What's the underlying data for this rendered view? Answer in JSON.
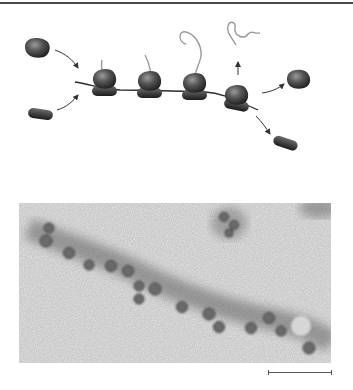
{
  "figure": {
    "type": "scientific-figure",
    "top_panel": {
      "name": "Polysome schematic",
      "description": "Multiple ribosomes translating a single mRNA strand",
      "elements": {
        "free_large_subunit_incoming": {
          "cx": 37,
          "cy": 49
        },
        "free_small_subunit_incoming": {
          "cx": 40,
          "cy": 115
        },
        "mrna_strand": {
          "from": [
            75,
            82
          ],
          "to": [
            258,
            110
          ]
        },
        "ribosomes": [
          {
            "index": 1,
            "cx": 104,
            "cy": 80,
            "nascent_chain": "short"
          },
          {
            "index": 2,
            "cx": 148,
            "cy": 82,
            "nascent_chain": "medium"
          },
          {
            "index": 3,
            "cx": 193,
            "cy": 84,
            "nascent_chain": "long"
          },
          {
            "index": 4,
            "cx": 238,
            "cy": 96,
            "nascent_chain": "released"
          }
        ],
        "released_polypeptide": {
          "arrow_direction": "up"
        },
        "free_large_subunit_released": {
          "cx": 298,
          "cy": 78
        },
        "free_small_subunit_released": {
          "cx": 285,
          "cy": 143
        }
      },
      "colors": {
        "subunit_fill": "#3c3c3c",
        "subunit_highlight": "#8a8a8a",
        "mrna": "#2a2a2a",
        "polypeptide": "#9a9a9a",
        "arrow": "#333333"
      }
    },
    "bottom_panel": {
      "name": "Electron micrograph of polysome",
      "background_color": "#c8c8c8",
      "strand_color": "#6e6e6e",
      "particle_count": 14
    },
    "scale_bar": {
      "label": ""
    },
    "top_rule_color": "#4a4a4a"
  }
}
